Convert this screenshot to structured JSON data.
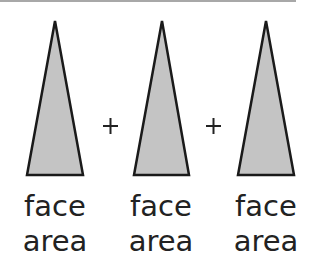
{
  "diagram": {
    "faces": [
      {
        "label_line1": "face",
        "label_line2": "area"
      },
      {
        "label_line1": "face",
        "label_line2": "area"
      },
      {
        "label_line1": "face",
        "label_line2": "area"
      }
    ],
    "operators": [
      "+",
      "+"
    ],
    "colors": {
      "face_fill": "#c4c4c4",
      "face_stroke": "#1a1a1a",
      "text": "#222222",
      "top_rule": "#a8a8a8"
    }
  }
}
